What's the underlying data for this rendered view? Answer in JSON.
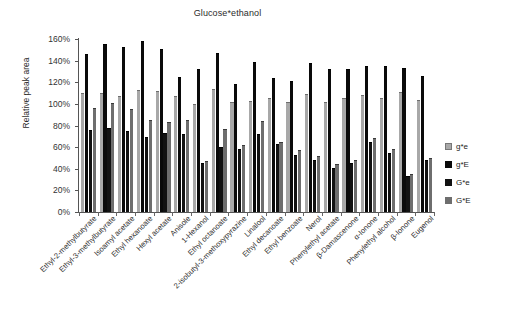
{
  "chart_data": {
    "type": "bar",
    "title": "Glucose*ethanol",
    "xlabel": "",
    "ylabel": "Relative peak area",
    "ylim": [
      0,
      160
    ],
    "ytick_step": 20,
    "ytick_labels": [
      "0%",
      "20%",
      "40%",
      "60%",
      "80%",
      "100%",
      "120%",
      "140%",
      "160%"
    ],
    "grid": false,
    "legend_position": "right",
    "categories": [
      "Ethyl-2-methylbutyrate",
      "Ethyl-3-methylbutyrate",
      "Isoamyl acetate",
      "Ethyl hexanoate",
      "Hexyl acetate",
      "Anisole",
      "1-Hexanol",
      "Ethyl octanoate",
      "2-isobutyl-3-methoxypyrazine",
      "Linalool",
      "Ethyl decanoate",
      "Ethyl benzoate",
      "Nerol",
      "Phenylethyl acetate",
      "β-Damascenone",
      "α-Ionone",
      "Phenylethyl alcohol",
      "β-Ionone",
      "Eugenol"
    ],
    "series": [
      {
        "name": "g*e",
        "color": "#a8a8a8",
        "values": [
          110,
          110,
          107,
          113,
          112,
          107,
          100,
          114,
          102,
          103,
          105,
          102,
          109,
          102,
          105,
          108,
          105,
          111,
          104
        ]
      },
      {
        "name": "g*E",
        "color": "#0a0a0a",
        "values": [
          146,
          155,
          153,
          158,
          151,
          125,
          132,
          147,
          118,
          139,
          124,
          121,
          138,
          132,
          132,
          135,
          135,
          133,
          126
        ]
      },
      {
        "name": "G*e",
        "color": "#121212",
        "values": [
          76,
          78,
          75,
          69,
          73,
          72,
          45,
          60,
          58,
          72,
          63,
          53,
          48,
          41,
          45,
          65,
          55,
          33,
          48
        ]
      },
      {
        "name": "G*E",
        "color": "#6e6e6e",
        "values": [
          96,
          101,
          95,
          85,
          83,
          85,
          47,
          77,
          62,
          84,
          65,
          57,
          52,
          44,
          48,
          68,
          58,
          35,
          50
        ]
      }
    ]
  },
  "legend": {
    "items": [
      {
        "label": "g*e"
      },
      {
        "label": "g*E"
      },
      {
        "label": "G*e"
      },
      {
        "label": "G*E"
      }
    ]
  }
}
